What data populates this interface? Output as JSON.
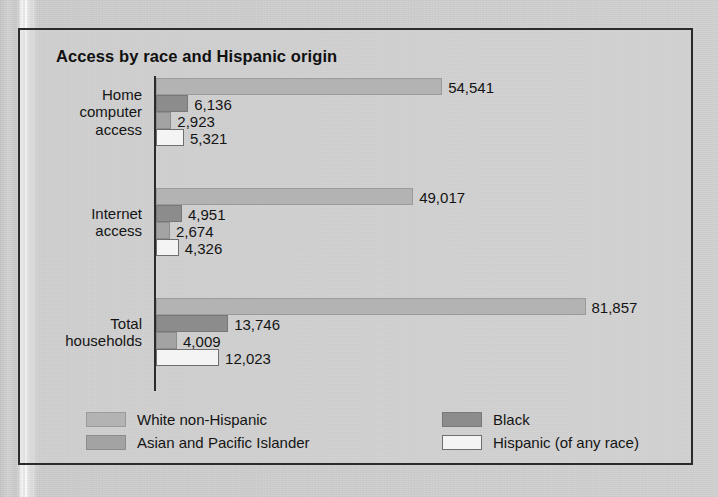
{
  "chart_data": {
    "type": "bar",
    "orientation": "horizontal",
    "title": "Access by race and Hispanic origin",
    "xlabel": "",
    "ylabel": "",
    "grid": false,
    "legend_position": "bottom",
    "axis_max": 85000,
    "categories": [
      "Home computer access",
      "Internet access",
      "Total households"
    ],
    "category_lines": [
      [
        "Home",
        "computer",
        "access"
      ],
      [
        "Internet",
        "access"
      ],
      [
        "Total",
        "households"
      ]
    ],
    "series": [
      {
        "name": "White non-Hispanic",
        "color": "#b3b3b3",
        "border": "#9a9a9a",
        "values": [
          54541,
          49017,
          81857
        ],
        "labels": [
          "54,541",
          "49,017",
          "81,857"
        ]
      },
      {
        "name": "Black",
        "color": "#8c8c8c",
        "border": "#787878",
        "values": [
          6136,
          4951,
          13746
        ],
        "labels": [
          "6,136",
          "4,951",
          "13,746"
        ]
      },
      {
        "name": "Asian and Pacific Islander",
        "color": "#a3a3a3",
        "border": "#8d8d8d",
        "values": [
          2923,
          2674,
          4009
        ],
        "labels": [
          "2,923",
          "2,674",
          "4,009"
        ]
      },
      {
        "name": "Hispanic (of any race)",
        "color": "#f4f4f4",
        "border": "#6f6f6f",
        "values": [
          5321,
          4326,
          12023
        ],
        "labels": [
          "5,321",
          "4,326",
          "12,023"
        ]
      }
    ]
  },
  "legend": {
    "items": [
      {
        "label": "White non-Hispanic",
        "color": "#b3b3b3",
        "border": "#9a9a9a"
      },
      {
        "label": "Black",
        "color": "#8c8c8c",
        "border": "#787878"
      },
      {
        "label": "Asian and Pacific Islander",
        "color": "#a3a3a3",
        "border": "#8d8d8d"
      },
      {
        "label": "Hispanic (of any race)",
        "color": "#f4f4f4",
        "border": "#6f6f6f"
      }
    ]
  }
}
